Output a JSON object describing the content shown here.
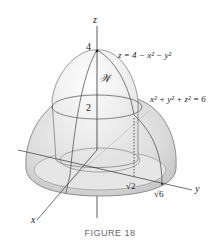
{
  "figure": {
    "caption": "FIGURE 18",
    "axes": {
      "x": "x",
      "y": "y",
      "z": "z"
    },
    "labels": {
      "paraboloid_eq": "z = 4 − x² − y²",
      "sphere_eq": "x² + y² + z² = 6",
      "region": "𝒲",
      "z_tick_4": "4",
      "z_tick_2": "2",
      "r_sqrt2": "√2",
      "r_sqrt6": "√6"
    },
    "colors": {
      "surface_fill": "#d9d9d9",
      "surface_light": "#f2f2f2",
      "outline": "#555555",
      "axis": "#333333"
    }
  }
}
